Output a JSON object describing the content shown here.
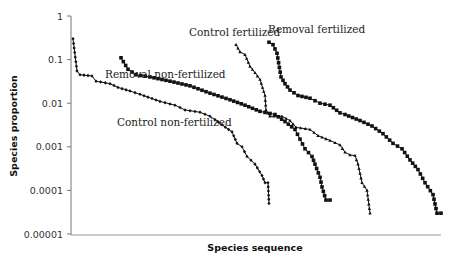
{
  "chart_data": {
    "type": "line",
    "title": "",
    "xlabel": "Species sequence",
    "ylabel": "Species proportion",
    "yscale": "log",
    "ylim": [
      1e-05,
      1
    ],
    "yticks": [
      "1",
      "0.1",
      "0.01",
      "0.001",
      "0.0001",
      "0.00001"
    ],
    "grid": false,
    "legend": "inline annotations",
    "annotations": [
      {
        "text": "Removal non-fertilized",
        "x": 105,
        "y": 78
      },
      {
        "text": "Control fertilized",
        "x": 189,
        "y": 36
      },
      {
        "text": "Removal fertilized",
        "x": 268,
        "y": 33
      },
      {
        "text": "Control non-fertilized",
        "x": 117,
        "y": 126
      }
    ],
    "series": [
      {
        "name": "Control non-fertilized",
        "marker": "diamond",
        "px_x": [
          73,
          77,
          80,
          92,
          96,
          110,
          118,
          130,
          140,
          160,
          175,
          185,
          200,
          210,
          215,
          222,
          232,
          237,
          242,
          247,
          255,
          262,
          265,
          268,
          269
        ],
        "values": [
          0.3,
          0.055,
          0.045,
          0.042,
          0.032,
          0.028,
          0.023,
          0.019,
          0.016,
          0.011,
          0.009,
          0.007,
          0.0062,
          0.005,
          0.0042,
          0.0032,
          0.0022,
          0.0012,
          0.001,
          0.0006,
          0.0004,
          0.00022,
          0.00015,
          0.00015,
          5e-05
        ]
      },
      {
        "name": "Removal non-fertilized",
        "marker": "square",
        "px_x": [
          121,
          128,
          136,
          150,
          170,
          190,
          210,
          230,
          245,
          260,
          275,
          285,
          295,
          300,
          305,
          312,
          315,
          320,
          322,
          326,
          330
        ],
        "values": [
          0.11,
          0.06,
          0.045,
          0.04,
          0.032,
          0.025,
          0.017,
          0.012,
          0.009,
          0.0065,
          0.0055,
          0.0038,
          0.0025,
          0.0015,
          0.0009,
          0.0006,
          0.0004,
          0.0002,
          0.00012,
          6e-05,
          6e-05
        ]
      },
      {
        "name": "Control fertilized",
        "marker": "triangle",
        "px_x": [
          236,
          240,
          245,
          250,
          255,
          260,
          265,
          266,
          270,
          282,
          290,
          296,
          310,
          318,
          330,
          340,
          345,
          350,
          355,
          358,
          362,
          367,
          370
        ],
        "values": [
          0.22,
          0.15,
          0.13,
          0.07,
          0.05,
          0.035,
          0.015,
          0.007,
          0.005,
          0.005,
          0.004,
          0.0028,
          0.0025,
          0.0018,
          0.0014,
          0.0011,
          0.00075,
          0.00065,
          0.00063,
          0.0004,
          0.00015,
          0.0001,
          3e-05
        ]
      },
      {
        "name": "Removal fertilized",
        "marker": "square",
        "px_x": [
          269,
          273,
          277,
          281,
          285,
          290,
          298,
          310,
          320,
          330,
          340,
          345,
          360,
          372,
          383,
          393,
          402,
          410,
          418,
          425,
          433,
          437,
          441
        ],
        "values": [
          0.25,
          0.22,
          0.14,
          0.04,
          0.028,
          0.02,
          0.015,
          0.013,
          0.01,
          0.009,
          0.006,
          0.0055,
          0.004,
          0.003,
          0.002,
          0.0012,
          0.0009,
          0.0005,
          0.0003,
          0.00015,
          8e-05,
          3e-05,
          3e-05
        ]
      }
    ]
  }
}
